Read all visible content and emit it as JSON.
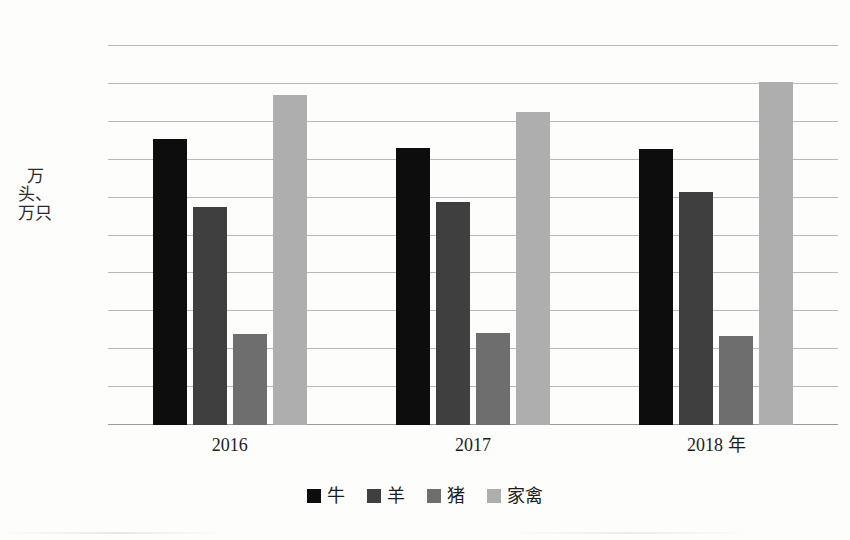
{
  "chart_data": {
    "type": "bar",
    "title": "",
    "subtitle": "",
    "xlabel": "",
    "ylabel": "万头、万只",
    "categories": [
      "2016",
      "2017",
      "2018 年"
    ],
    "series": [
      {
        "name": "牛",
        "color": "#0d0d0d",
        "values": [
          37.7,
          36.6,
          36.4
        ]
      },
      {
        "name": "羊",
        "color": "#3f3f3f",
        "values": [
          28.7,
          29.4,
          30.8
        ]
      },
      {
        "name": "猪",
        "color": "#6e6e6e",
        "values": [
          12.0,
          12.2,
          11.8
        ]
      },
      {
        "name": "家禽",
        "color": "#aeaeae",
        "values": [
          43.6,
          41.3,
          45.3
        ]
      }
    ],
    "ylim": [
      0,
      50
    ],
    "ytick_values": [
      0,
      5,
      10,
      15,
      20,
      25,
      30,
      35,
      40,
      45,
      50
    ],
    "ytick_labels": [
      "0",
      "5",
      "10",
      "15",
      "20",
      "25",
      "30",
      "35",
      "40",
      "45",
      "50"
    ],
    "grid": "horizontal",
    "legend_position": "bottom",
    "legend_entries": [
      "牛",
      "羊",
      "猪",
      "家禽"
    ],
    "annotations": []
  }
}
